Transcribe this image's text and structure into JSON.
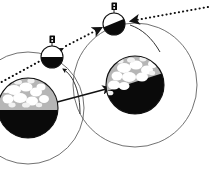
{
  "figure": {
    "title": "Tidally locked moon orbiting a planet at two orbital phases",
    "canvas": {
      "width": 209,
      "height": 181,
      "background": "#ffffff"
    },
    "palette": {
      "outline": "#111111",
      "dark_side": "#0a0a0a",
      "lit_side": "#ffffff",
      "planet_surface": "#b6b6b6",
      "cloud": "#ffffff",
      "orbit_stroke": "#4d4d4d",
      "arrow_stroke": "#111111"
    },
    "bodies": [
      {
        "id": "planet-left",
        "label": "planet-left",
        "kind": "planet",
        "cx": 28,
        "cy": 108,
        "r": 30,
        "terminator": "horizontal",
        "lit_portion": "top",
        "dark_portion": "bottom",
        "clipped_by_canvas_edge": true
      },
      {
        "id": "planet-right",
        "label": "planet-right",
        "kind": "planet",
        "cx": 135,
        "cy": 85,
        "r": 29,
        "terminator": "diagonal",
        "lit_portion": "upper-left",
        "dark_portion": "lower-right"
      },
      {
        "id": "moon-left",
        "label": "moon-left",
        "kind": "moon",
        "cx": 52,
        "cy": 57,
        "r": 11,
        "terminator": "horizontal",
        "lit_portion": "top",
        "dark_portion": "bottom",
        "has_marker": true
      },
      {
        "id": "moon-top",
        "label": "moon-top",
        "kind": "moon",
        "cx": 114,
        "cy": 24,
        "r": 11,
        "terminator": "diagonal",
        "lit_portion": "upper-left",
        "dark_portion": "lower-right",
        "has_marker": true
      }
    ],
    "orbits": [
      {
        "id": "orbit-left",
        "label": "orbit-left-planet",
        "cx": 28,
        "cy": 108,
        "r": 56
      },
      {
        "id": "orbit-right",
        "label": "orbit-right-planet",
        "cx": 135,
        "cy": 85,
        "r": 62
      }
    ],
    "arrows": [
      {
        "id": "arrow-planet-translation",
        "label": "planet-translation-arrow",
        "style": "solid",
        "from": [
          47,
          104
        ],
        "to": [
          112,
          88
        ],
        "has_arrowhead": true
      },
      {
        "id": "arrow-moon-orbit-left",
        "label": "moon-orbit-direction-left",
        "style": "solid-curved",
        "from": [
          78,
          110
        ],
        "to": [
          62,
          68
        ],
        "has_arrowhead": true
      },
      {
        "id": "arrow-moon-orbit-right",
        "label": "moon-orbit-direction-right",
        "style": "solid-curved",
        "from": [
          152,
          45
        ],
        "to": [
          132,
          25
        ],
        "has_arrowhead": false
      },
      {
        "id": "arrow-light-lower-left",
        "label": "incoming-light-ray-lower-left",
        "style": "dotted",
        "from": [
          0,
          82
        ],
        "to": [
          64,
          48
        ],
        "has_arrowhead": true
      },
      {
        "id": "arrow-light-upper-right",
        "label": "incoming-light-ray-upper-right",
        "style": "dotted",
        "from": [
          205,
          8
        ],
        "to": [
          128,
          22
        ],
        "has_arrowhead": true
      }
    ],
    "markers": [
      {
        "id": "marker-moon-left",
        "label": "surface-marker-moon-left",
        "x": 53,
        "y": 41
      },
      {
        "id": "marker-moon-top",
        "label": "surface-marker-moon-top",
        "x": 115,
        "y": 8
      }
    ]
  }
}
